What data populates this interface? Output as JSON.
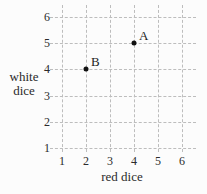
{
  "chart_data": {
    "type": "scatter",
    "title": "",
    "xlabel": "red dice",
    "ylabel": "white dice",
    "x_ticks": [
      "1",
      "2",
      "3",
      "4",
      "5",
      "6"
    ],
    "y_ticks": [
      "1",
      "2",
      "3",
      "4",
      "5",
      "6"
    ],
    "xlim": [
      1,
      6
    ],
    "ylim": [
      1,
      6
    ],
    "grid": "dashed",
    "legend": "none",
    "points": [
      {
        "label": "A",
        "x": 4,
        "y": 5
      },
      {
        "label": "B",
        "x": 2,
        "y": 4
      }
    ],
    "colors": {
      "grid": "#bdbdbd",
      "point": "#111111",
      "text": "#2b2b2b",
      "background": "#fcfcfc"
    }
  }
}
